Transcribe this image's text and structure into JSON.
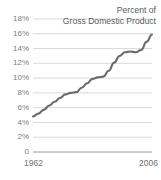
{
  "chart_data": {
    "type": "line",
    "title_line1": "Percent of",
    "title_line2": "Gross Domestic Product",
    "xlabel": "",
    "ylabel": "",
    "xlim": [
      1962,
      2006
    ],
    "ylim": [
      0,
      18
    ],
    "grid": true,
    "legend_position": "none",
    "line_color": "#6a6a6a",
    "grid_color": "#cfcfcf",
    "axis_color": "#9a9a9a",
    "tick_label_color": "#7d7d7d",
    "ytick_labels": [
      "18%",
      "16%",
      "14%",
      "12%",
      "10%",
      "8%",
      "6%",
      "4%",
      "2%",
      "0"
    ],
    "ytick_values": [
      18,
      16,
      14,
      12,
      10,
      8,
      6,
      4,
      2,
      0
    ],
    "xtick_labels": [
      "1962",
      "2006"
    ],
    "xtick_values": [
      1962,
      2006
    ],
    "x": [
      1962,
      1964,
      1966,
      1968,
      1970,
      1972,
      1974,
      1976,
      1978,
      1980,
      1982,
      1984,
      1986,
      1988,
      1990,
      1992,
      1994,
      1996,
      1998,
      2000,
      2002,
      2004,
      2006
    ],
    "values": [
      4.8,
      5.2,
      5.7,
      6.3,
      6.8,
      7.3,
      7.8,
      8.0,
      8.1,
      8.7,
      9.3,
      9.9,
      10.1,
      10.2,
      11.0,
      12.1,
      13.0,
      13.5,
      13.6,
      13.5,
      13.8,
      14.9,
      15.9
    ],
    "series": [
      {
        "name": "Percent of Gross Domestic Product",
        "values": [
          4.8,
          5.2,
          5.7,
          6.3,
          6.8,
          7.3,
          7.8,
          8.0,
          8.1,
          8.7,
          9.3,
          9.9,
          10.1,
          10.2,
          11.0,
          12.1,
          13.0,
          13.5,
          13.6,
          13.5,
          13.8,
          14.9,
          15.9
        ]
      }
    ]
  }
}
